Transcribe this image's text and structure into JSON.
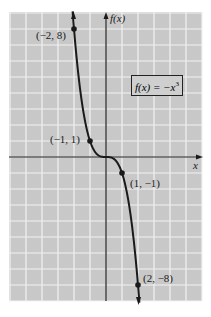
{
  "chart_data": {
    "type": "line",
    "title": "",
    "function_label": "f(x) = -x³",
    "xlabel": "x",
    "ylabel": "f(x)",
    "xlim": [
      -6,
      6
    ],
    "ylim": [
      -9,
      9
    ],
    "grid": true,
    "legend_position": "none",
    "series": [
      {
        "name": "f(x) = -x^3",
        "x": [
          -2,
          -1,
          0,
          1,
          2
        ],
        "y": [
          8,
          1,
          0,
          -1,
          -8
        ]
      }
    ],
    "annotations": [
      {
        "text": "(-2, 8)",
        "x": -2,
        "y": 8
      },
      {
        "text": "(-1, 1)",
        "x": -1,
        "y": 1
      },
      {
        "text": "(1, -1)",
        "x": 1,
        "y": -1
      },
      {
        "text": "(2, -8)",
        "x": 2,
        "y": -8
      }
    ]
  },
  "labels": {
    "y_axis": "f(x)",
    "x_axis": "x",
    "formula_prefix": "f(x) = −x",
    "formula_exp": "3",
    "p1": "(−2, 8)",
    "p2": "(−1, 1)",
    "p3": "(1, −1)",
    "p4": "(2, −8)"
  },
  "colors": {
    "grid_bg": "#c8c8c8",
    "grid_line": "#f2f2f2",
    "curve": "#1a1a1a"
  }
}
